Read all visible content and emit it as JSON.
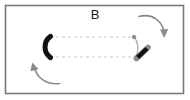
{
  "figure": {
    "panel_label": "B",
    "width": 190,
    "height": 100,
    "background_color": "#ffffff",
    "border_color": "#7a7a7a",
    "border_rect": {
      "x": 5.5,
      "y": 5.5,
      "width": 178,
      "height": 88
    }
  },
  "elements": {
    "arc": {
      "name": "thick-black-arc",
      "color": "#111111",
      "stroke_width": 5,
      "center": {
        "x": 57,
        "y": 47
      },
      "radius": 13,
      "opening": "right",
      "start_angle_deg": 125,
      "end_angle_deg": 235
    },
    "dashed_line_top": {
      "name": "dashed-guide-line-top",
      "color": "#c9c9c9",
      "dash": "3 3",
      "from": {
        "x": 56,
        "y": 37
      },
      "to": {
        "x": 133,
        "y": 37
      }
    },
    "dashed_line_bottom": {
      "name": "dashed-guide-line-bottom",
      "color": "#c9c9c9",
      "dash": "3 3",
      "from": {
        "x": 56,
        "y": 57
      },
      "to": {
        "x": 135,
        "y": 57
      }
    },
    "pivot_dot_top": {
      "name": "pivot-dot-top",
      "color": "#8f8f8f",
      "cx": 134,
      "cy": 37,
      "r": 2.2
    },
    "pivot_dot_bottom": {
      "name": "pivot-dot-bottom",
      "color": "#8f8f8f",
      "cx": 136,
      "cy": 57.5,
      "r": 2.2
    },
    "connector_curve": {
      "name": "gray-connector-curve",
      "color": "#a8a8a8",
      "stroke_width": 1.2,
      "path": "M 134 37 C 139 43 138 50 136 57"
    },
    "diagonal_bar": {
      "name": "black-diagonal-bar",
      "color": "#131313",
      "stroke_width": 4.5,
      "cap_color": "#8a8a8a",
      "from": {
        "x": 136.5,
        "y": 58.5
      },
      "to": {
        "x": 148,
        "y": 47.5
      },
      "angle_deg": -44
    },
    "arrow_top_right": {
      "name": "rotation-arrow-top-right",
      "color": "#8a8a8a",
      "stroke_width": 1.6,
      "path": "M 139 16 C 152 13 162 21 164 33",
      "head": "M 164 37 L 160.3 29.6 L 167.7 29.6 Z",
      "direction": "clockwise-down"
    },
    "arrow_bottom_left": {
      "name": "rotation-arrow-bottom-left",
      "color": "#8a8a8a",
      "stroke_width": 1.6,
      "path": "M 59 84 C 46 85 37 77 34 67",
      "head": "M 32.5 63 L 37.6 69.3 L 30.3 70.6 Z",
      "direction": "counterclockwise-up"
    }
  }
}
